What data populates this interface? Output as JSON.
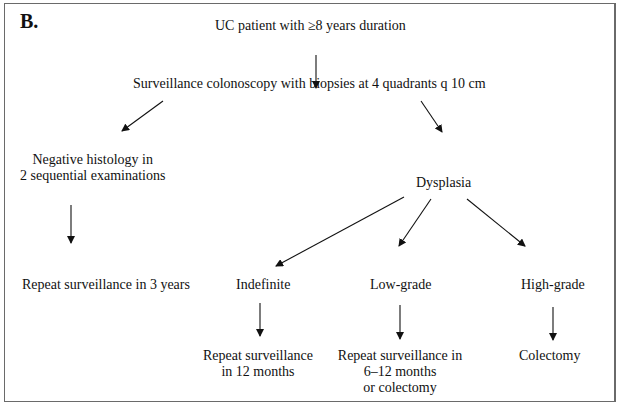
{
  "panel_label": "B.",
  "nodes": {
    "start": "UC patient with ≥8 years duration",
    "surveillance": "Surveillance colonoscopy with biopsies at 4 quadrants q 10 cm",
    "negative_line1": "Negative histology in",
    "negative_line2": "2 sequential examinations",
    "dysplasia": "Dysplasia",
    "repeat_3y": "Repeat surveillance in 3 years",
    "indefinite": "Indefinite",
    "low_grade": "Low-grade",
    "high_grade": "High-grade",
    "indefinite_action_line1": "Repeat surveillance",
    "indefinite_action_line2": "in 12 months",
    "low_action_line1": "Repeat surveillance in",
    "low_action_line2": "6–12 months",
    "low_action_line3": "or colectomy",
    "high_action": "Colectomy"
  },
  "colors": {
    "text": "#111111",
    "arrow": "#111111",
    "border": "#6a6a6a"
  }
}
